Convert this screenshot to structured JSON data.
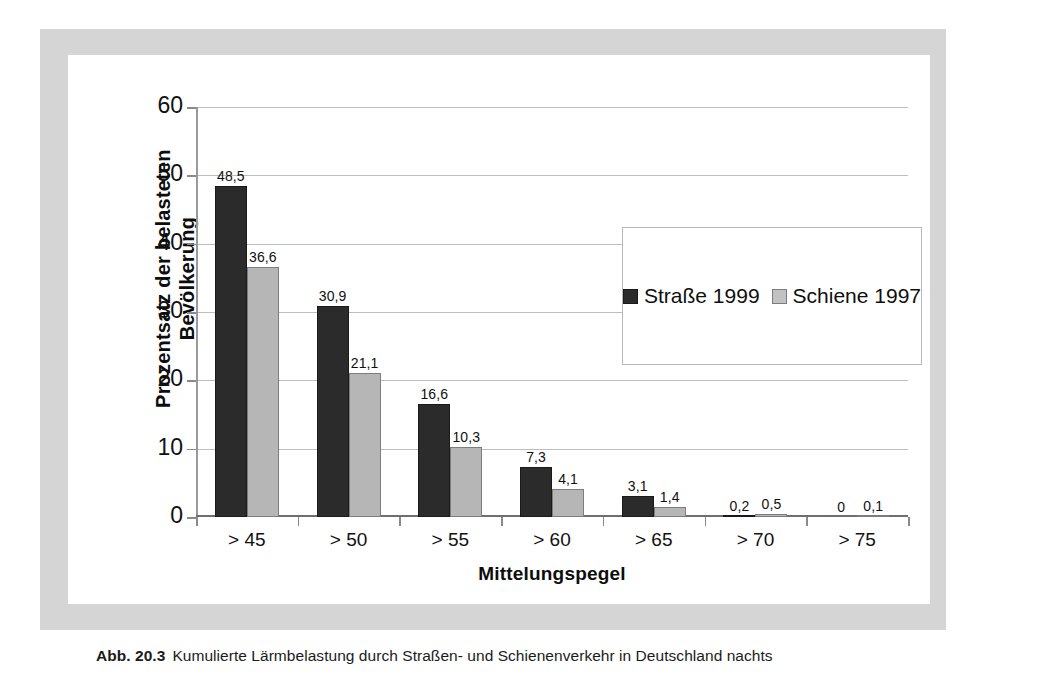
{
  "figure": {
    "caption_label": "Abb. 20.3",
    "caption_text": "Kumulierte Lärmbelastung durch Straßen- und Schienenverkehr in Deutschland nachts"
  },
  "colors": {
    "series_road": "#2b2b2b",
    "series_rail": "#b6b6b6",
    "frame": "#d5d5d5",
    "gridline": "#bdbdbd",
    "plate": "#ffffff"
  },
  "chart_data": {
    "type": "bar",
    "title": "",
    "subtitle": "",
    "xlabel": "Mittelungspegel",
    "ylabel": "Prozentsatz der belasteten Bevölkerung",
    "ylabel_lines": [
      "Prozentsatz der belasteten",
      "Bevölkerung"
    ],
    "categories": [
      "> 45",
      "> 50",
      "> 55",
      "> 60",
      "> 65",
      "> 70",
      "> 75"
    ],
    "ylim": [
      0,
      60
    ],
    "yticks": [
      0,
      10,
      20,
      30,
      40,
      50,
      60
    ],
    "ytick_labels": [
      "0",
      "10",
      "20",
      "30",
      "40",
      "50",
      "60"
    ],
    "grid": true,
    "grid_axis": "y",
    "legend_position": "inside-right",
    "series": [
      {
        "name": "Straße 1999",
        "color": "#2b2b2b",
        "values": [
          48.5,
          30.9,
          16.6,
          7.3,
          3.1,
          0.2,
          0
        ],
        "labels": [
          "48,5",
          "30,9",
          "16,6",
          "7,3",
          "3,1",
          "0,2",
          "0"
        ]
      },
      {
        "name": "Schiene 1997",
        "color": "#b6b6b6",
        "values": [
          36.6,
          21.1,
          10.3,
          4.1,
          1.4,
          0.5,
          0.1
        ],
        "labels": [
          "36,6",
          "21,1",
          "10,3",
          "4,1",
          "1,4",
          "0,5",
          "0,1"
        ]
      }
    ]
  }
}
